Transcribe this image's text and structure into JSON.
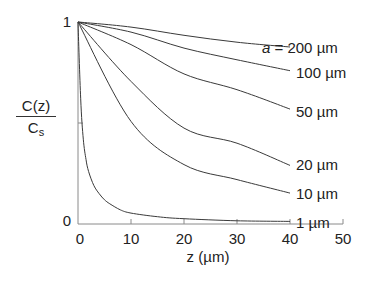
{
  "chart_data": {
    "type": "line",
    "title": "",
    "xlabel": "z (µm)",
    "ylabel_numerator": "C(z)",
    "ylabel_denominator_main": "C",
    "ylabel_denominator_sub": "s",
    "xlim": [
      0,
      50
    ],
    "ylim": [
      0,
      1
    ],
    "x_ticks": [
      0,
      10,
      20,
      30,
      40,
      50
    ],
    "x_tick_labels": [
      "0",
      "10",
      "20",
      "30",
      "40",
      "50"
    ],
    "y_ticks": [
      0,
      0.5,
      1
    ],
    "y_tick_labels": [
      "0",
      "",
      "1"
    ],
    "grid": false,
    "legend": "inline labels at right end of curves",
    "x": [
      0,
      10,
      20,
      30,
      40
    ],
    "series": [
      {
        "name": "a = 200 µm",
        "label_prefix": "a",
        "label_rest": " = 200 µm",
        "values": [
          1.0,
          0.975,
          0.934,
          0.9,
          0.876
        ]
      },
      {
        "name": "100 µm",
        "label_prefix": "",
        "label_rest": "100 µm",
        "values": [
          1.0,
          0.95,
          0.871,
          0.813,
          0.759
        ]
      },
      {
        "name": "50 µm",
        "label_prefix": "",
        "label_rest": "50 µm",
        "values": [
          1.0,
          0.888,
          0.743,
          0.665,
          0.569
        ]
      },
      {
        "name": "20 µm",
        "label_prefix": "",
        "label_rest": "20 µm",
        "values": [
          1.0,
          0.706,
          0.475,
          0.4,
          0.29
        ]
      },
      {
        "name": "10 µm",
        "label_prefix": "",
        "label_rest": "10 µm",
        "values": [
          1.0,
          0.508,
          0.294,
          0.22,
          0.153
        ]
      },
      {
        "name": "1 µm",
        "label_prefix": "",
        "label_rest": "1 µm",
        "values": [
          1.0,
          0.054,
          0.026,
          0.016,
          0.013
        ]
      }
    ],
    "curve_detail_1um": {
      "x": [
        0,
        0.5,
        1,
        1.5,
        2,
        3,
        4,
        5,
        6,
        8,
        10,
        15,
        20,
        30,
        40
      ],
      "values": [
        1.0,
        0.62,
        0.42,
        0.32,
        0.26,
        0.19,
        0.15,
        0.12,
        0.1,
        0.07,
        0.054,
        0.036,
        0.026,
        0.016,
        0.013
      ]
    }
  }
}
